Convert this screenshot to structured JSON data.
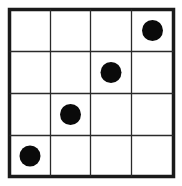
{
  "diagram": {
    "type": "grid-with-dots",
    "rows": 4,
    "cols": 4,
    "colors": {
      "background": "#ffffff",
      "line": "#1a1a1a",
      "dot": "#0a0a0a"
    },
    "dots": [
      {
        "row": 0,
        "col": 3
      },
      {
        "row": 1,
        "col": 2
      },
      {
        "row": 2,
        "col": 1
      },
      {
        "row": 3,
        "col": 0
      }
    ]
  }
}
